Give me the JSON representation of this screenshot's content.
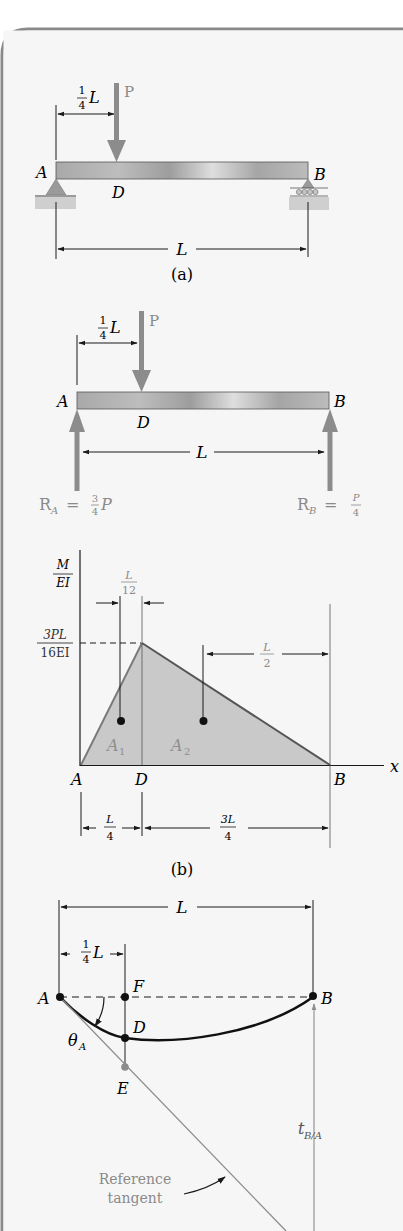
{
  "figure": {
    "panel_a": {
      "caption": "(a)",
      "load_label": "P",
      "load_offset": {
        "num": "1",
        "den": "4",
        "var": "L"
      },
      "point_A": "A",
      "point_B": "B",
      "point_D": "D",
      "span_label": "L"
    },
    "panel_b_fbd": {
      "load_label": "P",
      "load_offset": {
        "num": "1",
        "den": "4",
        "var": "L"
      },
      "point_A": "A",
      "point_B": "B",
      "point_D": "D",
      "span_label": "L",
      "reaction_A": {
        "prefix": "R",
        "sub": "A",
        "eq": " = ",
        "num": "3",
        "den": "4",
        "suffix": "P"
      },
      "reaction_B": {
        "prefix": "R",
        "sub": "B",
        "eq": " = ",
        "num": "P",
        "den": "4"
      }
    },
    "panel_b_moment": {
      "caption": "(b)",
      "y_axis_label": {
        "num": "M",
        "den": "EI"
      },
      "x_axis_label": "x",
      "peak_value": {
        "num": "3PL",
        "den": "16EI"
      },
      "offset_A1": {
        "num": "L",
        "den": "12"
      },
      "offset_A2": {
        "num": "L",
        "den": "2"
      },
      "area_1": {
        "base": "A",
        "sub": "1"
      },
      "area_2": {
        "base": "A",
        "sub": "2"
      },
      "point_A": "A",
      "point_D": "D",
      "point_B": "B",
      "dim_AD": {
        "num": "L",
        "den": "4"
      },
      "dim_DB": {
        "num": "3L",
        "den": "4"
      }
    },
    "panel_c_deflection": {
      "span_label": "L",
      "offset": {
        "num": "1",
        "den": "4",
        "var": "L"
      },
      "point_A": "A",
      "point_B": "B",
      "point_D": "D",
      "point_E": "E",
      "point_F": "F",
      "theta": {
        "base": "θ",
        "sub": "A"
      },
      "tangential_deviation": {
        "base": "t",
        "sub": "B/A"
      },
      "reference_tangent_line1": "Reference",
      "reference_tangent_line2": "tangent"
    }
  },
  "colors": {
    "frame": "#8a8a8a",
    "beam_fill": "#b8b8b8",
    "arrow_gray": "#8c8c8c",
    "area_fill": "#c9c9c9",
    "moment_edge": "#7a7a7a",
    "label_gray": "#8a8a8a",
    "ink": "#1a1a1a"
  }
}
